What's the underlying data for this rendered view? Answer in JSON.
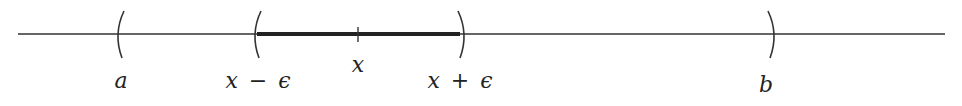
{
  "diagram": {
    "type": "number-line-neighborhood",
    "colors": {
      "line": "#333333",
      "highlight": "#222222",
      "text": "#222222",
      "background": "#ffffff"
    },
    "axis": {
      "x_start": 18,
      "x_end": 945,
      "y": 34
    },
    "brackets": [
      {
        "id": "a",
        "kind": "open-left",
        "x": 120,
        "label": "a"
      },
      {
        "id": "x-minus-eps",
        "kind": "open-left",
        "x": 257,
        "label": "x − ϵ"
      },
      {
        "id": "x-plus-eps",
        "kind": "open-right",
        "x": 460,
        "label": "x + ϵ"
      },
      {
        "id": "b",
        "kind": "open-right",
        "x": 770,
        "label": "b"
      }
    ],
    "center_tick": {
      "x": 358,
      "label": "x"
    },
    "highlight_segment": {
      "from": 257,
      "to": 460
    },
    "labels": {
      "a": "a",
      "x_minus_eps_var": "x",
      "x_minus_eps_op": "−",
      "x_minus_eps_eps": "ϵ",
      "x": "x",
      "x_plus_eps_var": "x",
      "x_plus_eps_op": "+",
      "x_plus_eps_eps": "ϵ",
      "b": "b"
    }
  }
}
